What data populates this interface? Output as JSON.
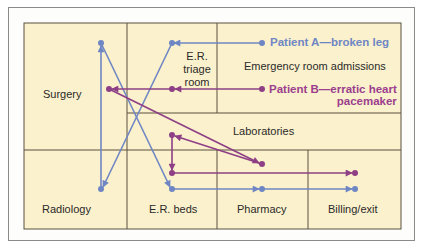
{
  "colors": {
    "background": "#fbf1cc",
    "grid_line": "#5a5040",
    "patient_a": "#6f86c4",
    "patient_b": "#8e3f86",
    "text": "#2a2a2a"
  },
  "rooms": {
    "surgery": "Surgery",
    "er_triage": [
      "E.R.",
      "triage",
      "room"
    ],
    "emergency_admissions": "Emergency room admissions",
    "laboratories": "Laboratories",
    "radiology": "Radiology",
    "er_beds": "E.R. beds",
    "pharmacy": "Pharmacy",
    "billing": "Billing/exit"
  },
  "legend": {
    "patient_a": "Patient A—broken leg",
    "patient_b_line1": "Patient B—erratic heart",
    "patient_b_line2": "pacemaker"
  },
  "paths": {
    "patient_a": {
      "label": "Patient A—broken leg",
      "sequence": [
        "Emergency room admissions",
        "E.R. triage room",
        "Radiology",
        "Surgery",
        "E.R. beds",
        "Pharmacy",
        "Billing/exit"
      ]
    },
    "patient_b": {
      "label": "Patient B—erratic heart pacemaker",
      "sequence": [
        "Emergency room admissions",
        "E.R. triage room",
        "Surgery",
        "Laboratories",
        "Laboratories (return)",
        "E.R. beds",
        "Billing/exit"
      ]
    }
  }
}
